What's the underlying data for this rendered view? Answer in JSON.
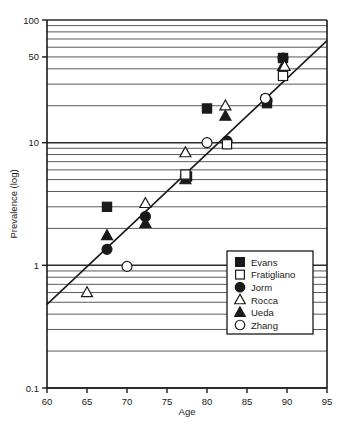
{
  "chart_data": {
    "type": "scatter",
    "title": "",
    "xlabel": "Age",
    "ylabel": "Prevalence (log)",
    "xlim": [
      60,
      95
    ],
    "ylim": [
      0.1,
      100
    ],
    "yscale": "log",
    "xticks": [
      60,
      65,
      70,
      75,
      80,
      85,
      90,
      95
    ],
    "xticklabels": [
      "60",
      "65",
      "70",
      "75",
      "80",
      "85",
      "90",
      "95"
    ],
    "yticks": [
      0.1,
      1,
      10,
      50,
      100
    ],
    "yticklabels": [
      "0.1",
      "1",
      "10",
      "50",
      "100"
    ],
    "grid": "horizontal-minor-log",
    "legend_position": "lower-right-inside",
    "trendline": {
      "label": "fitted regression line",
      "x_start": 60,
      "y_start": 0.48,
      "x_end": 95,
      "y_end": 68
    },
    "series": [
      {
        "name": "Evans",
        "marker": "filled-square",
        "points": [
          {
            "x": 67.5,
            "y": 3.0
          },
          {
            "x": 77.5,
            "y": 5.3
          },
          {
            "x": 80.0,
            "y": 19.0
          },
          {
            "x": 87.5,
            "y": 21.0
          },
          {
            "x": 89.5,
            "y": 49.0
          }
        ]
      },
      {
        "name": "Fratigliano",
        "marker": "open-square",
        "points": [
          {
            "x": 77.3,
            "y": 5.5
          },
          {
            "x": 82.5,
            "y": 9.7
          },
          {
            "x": 89.5,
            "y": 35.0
          }
        ]
      },
      {
        "name": "Jorm",
        "marker": "filled-circle",
        "points": [
          {
            "x": 67.5,
            "y": 1.35
          },
          {
            "x": 72.3,
            "y": 2.5
          },
          {
            "x": 77.3,
            "y": 5.3
          },
          {
            "x": 82.5,
            "y": 10.3
          },
          {
            "x": 87.5,
            "y": 22.0
          },
          {
            "x": 89.5,
            "y": 49.0
          }
        ]
      },
      {
        "name": "Rocca",
        "marker": "open-triangle",
        "points": [
          {
            "x": 65.0,
            "y": 0.6
          },
          {
            "x": 72.3,
            "y": 3.2
          },
          {
            "x": 77.3,
            "y": 8.3
          },
          {
            "x": 82.3,
            "y": 20.0
          },
          {
            "x": 89.7,
            "y": 42.0
          }
        ]
      },
      {
        "name": "Ueda",
        "marker": "filled-triangle",
        "points": [
          {
            "x": 67.5,
            "y": 1.75
          },
          {
            "x": 72.3,
            "y": 2.2
          },
          {
            "x": 77.3,
            "y": 5.0
          },
          {
            "x": 82.3,
            "y": 16.5
          },
          {
            "x": 89.5,
            "y": 42.0
          }
        ]
      },
      {
        "name": "Zhang",
        "marker": "open-circle",
        "points": [
          {
            "x": 70.0,
            "y": 0.98
          },
          {
            "x": 80.0,
            "y": 10.0
          },
          {
            "x": 87.3,
            "y": 23.0
          }
        ]
      }
    ],
    "legend": [
      {
        "label": "Evans",
        "marker": "filled-square"
      },
      {
        "label": "Fratigliano",
        "marker": "open-square"
      },
      {
        "label": "Jorm",
        "marker": "filled-circle"
      },
      {
        "label": "Rocca",
        "marker": "open-triangle"
      },
      {
        "label": "Ueda",
        "marker": "filled-triangle"
      },
      {
        "label": "Zhang",
        "marker": "open-circle"
      }
    ],
    "colors": {
      "marker_fill": "#1a1a1a",
      "marker_open_fill": "#ffffff",
      "marker_stroke": "#1a1a1a",
      "axis": "#1a1a1a",
      "grid": "#555555",
      "background": "#ffffff",
      "trendline": "#1a1a1a"
    }
  }
}
